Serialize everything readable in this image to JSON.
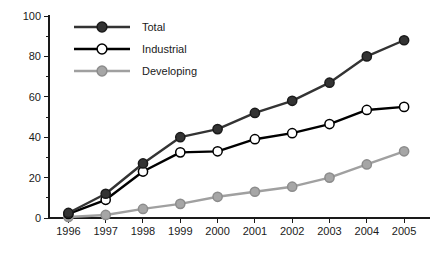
{
  "chart_data": {
    "type": "line",
    "title": "",
    "subtitle": "",
    "xlabel": "",
    "ylabel": "",
    "categories": [
      "1996",
      "1997",
      "1998",
      "1999",
      "2000",
      "2001",
      "2002",
      "2003",
      "2004",
      "2005"
    ],
    "x": [
      1996,
      1997,
      1998,
      1999,
      2000,
      2001,
      2002,
      2003,
      2004,
      2005
    ],
    "ylim": [
      0,
      100
    ],
    "yticks": [
      0,
      20,
      40,
      60,
      80,
      100
    ],
    "ytick_labels": [
      "0",
      "20",
      "40",
      "60",
      "80",
      "100"
    ],
    "yminor_ticks": [
      10,
      30,
      50,
      70,
      90
    ],
    "grid": false,
    "legend_position": "top-left",
    "series": [
      {
        "name": "Total",
        "values": [
          2.5,
          12,
          27,
          40,
          44,
          52,
          58,
          67,
          80,
          88
        ],
        "color": "#333333",
        "marker": "filled-circle",
        "marker_fill": "#333333",
        "marker_edge": "#1a1a1a"
      },
      {
        "name": "Industrial",
        "values": [
          2,
          9,
          23,
          32.5,
          33,
          39,
          42,
          46.5,
          53.5,
          55
        ],
        "color": "#000000",
        "marker": "open-circle",
        "marker_fill": "#ffffff",
        "marker_edge": "#000000"
      },
      {
        "name": "Developing",
        "values": [
          0.5,
          1.5,
          4.5,
          7,
          10.5,
          13,
          15.5,
          20,
          26.5,
          33
        ],
        "color": "#a0a0a0",
        "marker": "filled-circle",
        "marker_fill": "#a6a6a6",
        "marker_edge": "#8c8c8c"
      }
    ]
  },
  "colors": {
    "background": "#ffffff",
    "axis": "#1a1a1a",
    "total": "#333333",
    "industrial": "#000000",
    "developing": "#a0a0a0"
  }
}
